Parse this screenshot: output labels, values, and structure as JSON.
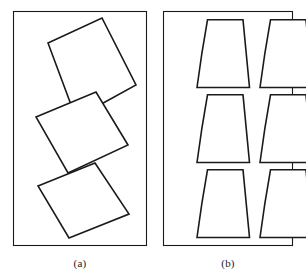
{
  "figure": {
    "width": 306,
    "height": 278,
    "background_color": "#ffffff",
    "stroke_color": "#1a1a1a",
    "fill_color": "#ffffff",
    "panels": [
      {
        "id": "panel-a",
        "caption": "(a)",
        "frame": {
          "x": 13,
          "y": 11,
          "width": 133,
          "height": 234,
          "stroke_width": 1.1
        },
        "shape_kind": "rotated-quadrilateral",
        "shape_count": 3,
        "packing": "loose",
        "shapes": [
          {
            "name": "quad-1",
            "points": "48,43 102,18 136,85 76,118",
            "stroke_width": 1.6
          },
          {
            "name": "quad-2",
            "points": "36,117 96,92 128,145 68,173",
            "stroke_width": 1.6
          },
          {
            "name": "quad-3",
            "points": "38,186 95,163 129,214 69,238",
            "stroke_width": 1.6
          }
        ]
      },
      {
        "id": "panel-b",
        "caption": "(b)",
        "frame": {
          "x": 163,
          "y": 11,
          "width": 129,
          "height": 234,
          "stroke_width": 1.1
        },
        "shape_kind": "trapezoid-skirt-panel",
        "shape_count": 6,
        "packing": "tight-grid",
        "grid": {
          "rows": 3,
          "columns": 2
        },
        "shapes": [
          {
            "name": "trapezoid-r1-c1",
            "cx": 196,
            "cy": 19,
            "stroke_width": 1.6
          },
          {
            "name": "trapezoid-r1-c2",
            "cx": 259,
            "cy": 19,
            "stroke_width": 1.6
          },
          {
            "name": "trapezoid-r2-c1",
            "cx": 196,
            "cy": 94,
            "stroke_width": 1.6
          },
          {
            "name": "trapezoid-r2-c2",
            "cx": 259,
            "cy": 94,
            "stroke_width": 1.6
          },
          {
            "name": "trapezoid-r3-c1",
            "cx": 196,
            "cy": 169,
            "stroke_width": 1.6
          },
          {
            "name": "trapezoid-r3-c2",
            "cx": 259,
            "cy": 169,
            "stroke_width": 1.6
          }
        ]
      }
    ]
  },
  "captions": {
    "panel_a": "(a)",
    "panel_b": "(b)"
  },
  "colors": {
    "stroke": "#1a1a1a",
    "background": "#ffffff",
    "shape_fill": "#ffffff"
  }
}
